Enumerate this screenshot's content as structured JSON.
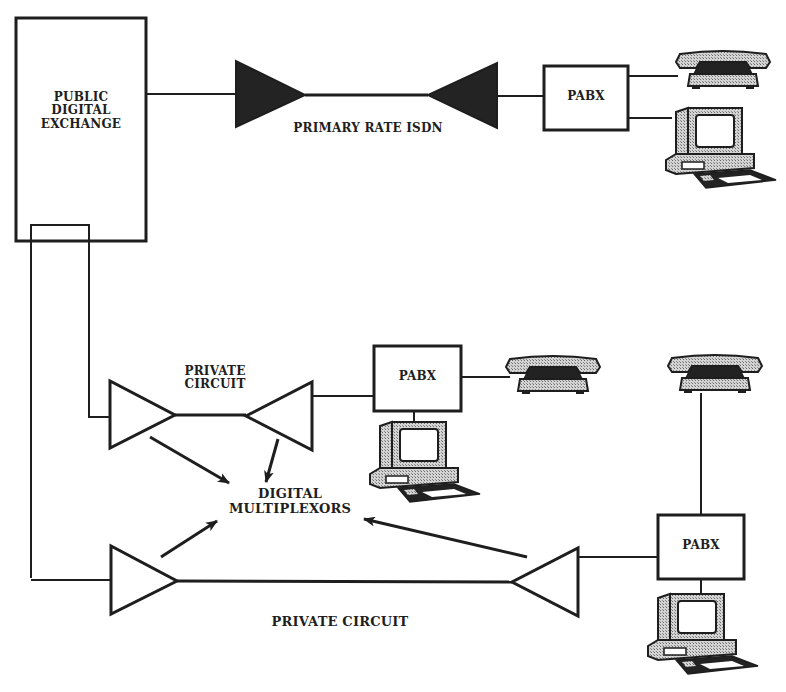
{
  "diagram": {
    "colors": {
      "line": "#1e1e1e",
      "fill_solid": "#232323",
      "fill_hatch": "#b9b9b9",
      "background": "#ffffff"
    },
    "nodes": {
      "exchange": {
        "label": "PUBLIC\nDIGITAL\nEXCHANGE"
      },
      "pabx_top": {
        "label": "PABX"
      },
      "pabx_middle": {
        "label": "PABX"
      },
      "pabx_bottom": {
        "label": "PABX"
      },
      "multiplexors": {
        "label": "DIGITAL\nMULTIPLEXORS"
      }
    },
    "links": {
      "isdn": {
        "label": "PRIMARY RATE ISDN"
      },
      "private_circuit_upper": {
        "label": "PRIVATE\nCIRCUIT"
      },
      "private_circuit_lower": {
        "label": "PRIVATE CIRCUIT"
      }
    },
    "icons": {
      "telephone": "telephone-icon",
      "computer": "computer-terminal-icon",
      "multiplexor_solid": "filled-triangle-multiplexor-icon",
      "multiplexor_outline": "outline-triangle-multiplexor-icon"
    }
  }
}
